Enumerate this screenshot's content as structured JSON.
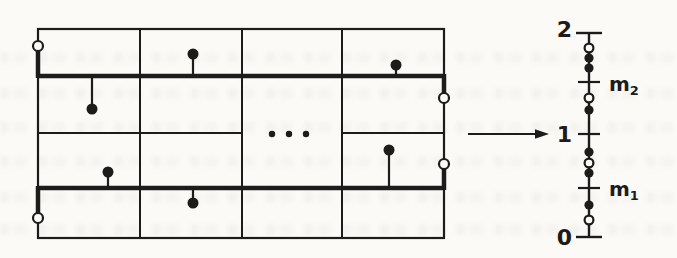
{
  "colors": {
    "ink": "#1d1c1a",
    "paper": "#fbfaf7"
  },
  "domain_grid": {
    "outer": {
      "x": 38,
      "y": 29,
      "w": 406,
      "h": 209
    },
    "column_dividers_x": [
      140,
      242,
      342
    ],
    "thick_row_lines": [
      {
        "y": 76,
        "x1": 38,
        "x2": 444
      },
      {
        "y": 188,
        "x1": 38,
        "x2": 444
      }
    ],
    "thin_row_segments": [
      {
        "y": 133,
        "x1": 38,
        "x2": 242
      },
      {
        "y": 133,
        "x1": 342,
        "x2": 444
      }
    ],
    "thick_edge_segments": [
      {
        "x": 38,
        "y1": 46,
        "y2": 78
      },
      {
        "x": 444,
        "y1": 74,
        "y2": 98
      },
      {
        "x": 444,
        "y1": 164,
        "y2": 190
      },
      {
        "x": 38,
        "y1": 186,
        "y2": 219
      }
    ],
    "sample_points": [
      {
        "x": 193,
        "y": 54,
        "attach_y": 76
      },
      {
        "x": 396,
        "y": 65,
        "attach_y": 76
      },
      {
        "x": 92,
        "y": 109,
        "attach_y": 76
      },
      {
        "x": 108,
        "y": 172,
        "attach_y": 188
      },
      {
        "x": 389,
        "y": 150,
        "attach_y": 188
      },
      {
        "x": 193,
        "y": 203,
        "attach_y": 188
      }
    ],
    "open_endpoints": [
      {
        "x": 38,
        "y": 46
      },
      {
        "x": 444,
        "y": 98
      },
      {
        "x": 444,
        "y": 164
      },
      {
        "x": 38,
        "y": 218
      }
    ],
    "ellipsis_dots": [
      {
        "x": 272,
        "y": 134
      },
      {
        "x": 289,
        "y": 134
      },
      {
        "x": 306,
        "y": 134
      }
    ]
  },
  "mapping_arrow": {
    "x1": 468,
    "x2": 549,
    "y": 134
  },
  "value_axis": {
    "x": 589,
    "y_top": 33,
    "y_bottom": 237,
    "end_caps_y": [
      33,
      237
    ],
    "ticks_y": [
      82,
      134,
      188
    ],
    "open_markers_y": [
      48,
      98,
      163,
      220
    ],
    "filled_markers_y": [
      58,
      68,
      110,
      152,
      173,
      205
    ],
    "numeric_labels": [
      {
        "text": "2",
        "x": 572,
        "y": 30
      },
      {
        "text": "1",
        "x": 572,
        "y": 135
      },
      {
        "text": "0",
        "x": 572,
        "y": 238
      }
    ],
    "tick_labels": [
      {
        "base": "m",
        "sub": "2",
        "x": 609,
        "y": 84
      },
      {
        "base": "m",
        "sub": "1",
        "x": 609,
        "y": 189
      }
    ]
  },
  "noise_bands_y": [
    52,
    88,
    122,
    156,
    192,
    224
  ]
}
